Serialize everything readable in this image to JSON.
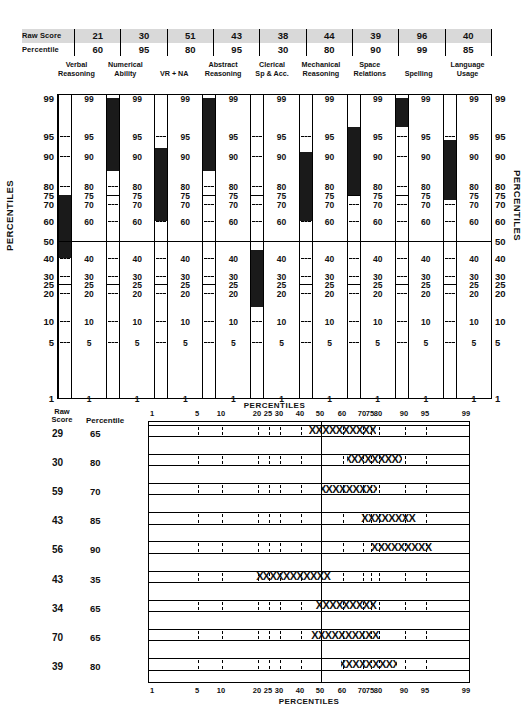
{
  "header": {
    "row_labels": [
      "Raw Score",
      "Percentile"
    ],
    "tests": [
      {
        "name_line1": "Verbal",
        "name_line2": "Reasoning",
        "raw": "21",
        "percentile": "60"
      },
      {
        "name_line1": "Numerical",
        "name_line2": "Ability",
        "raw": "30",
        "percentile": "95"
      },
      {
        "name_line1": "VR + NA",
        "name_line2": "",
        "raw": "51",
        "percentile": "80"
      },
      {
        "name_line1": "Abstract",
        "name_line2": "Reasoning",
        "raw": "43",
        "percentile": "95"
      },
      {
        "name_line1": "Clerical",
        "name_line2": "Sp & Acc.",
        "raw": "38",
        "percentile": "30"
      },
      {
        "name_line1": "Mechanical",
        "name_line2": "Reasoning",
        "raw": "44",
        "percentile": "80"
      },
      {
        "name_line1": "Space",
        "name_line2": "Relations",
        "raw": "39",
        "percentile": "90"
      },
      {
        "name_line1": "Spelling",
        "name_line2": "",
        "raw": "96",
        "percentile": "99"
      },
      {
        "name_line1": "Language",
        "name_line2": "Usage",
        "raw": "40",
        "percentile": "85"
      }
    ]
  },
  "profile_chart": {
    "axis_title": "PERCENTILES",
    "caption": "PERCENTILES",
    "scale_ticks": [
      "99",
      "95",
      "90",
      "80",
      "75",
      "70",
      "60",
      "50",
      "40",
      "30",
      "25",
      "20",
      "10",
      "5",
      "1"
    ],
    "column_labels": [
      "99",
      "95",
      "90",
      "80",
      "75",
      "70",
      "60",
      "40",
      "30",
      "25",
      "20",
      "10",
      "5",
      "1"
    ]
  },
  "bottom_chart": {
    "col_header_line1": "Raw",
    "col_header_line2": "Score",
    "col_header_percentile": "Percentile",
    "caption_top": "PERCENTILES",
    "caption_bottom": "PERCENTILES",
    "axis_ticks": [
      "1",
      "5",
      "10",
      "20",
      "25",
      "30",
      "40",
      "50",
      "60",
      "70",
      "75",
      "80",
      "90",
      "95",
      "99"
    ],
    "rows": [
      {
        "raw": "29",
        "percentile": "65",
        "marks": "XXXXXXXXXX"
      },
      {
        "raw": "30",
        "percentile": "80",
        "marks": "XXXXXXXXX"
      },
      {
        "raw": "59",
        "percentile": "70",
        "marks": "XXXXXXXXX"
      },
      {
        "raw": "43",
        "percentile": "85",
        "marks": "XXXXXXXX"
      },
      {
        "raw": "56",
        "percentile": "90",
        "marks": "XXXXXXXXX"
      },
      {
        "raw": "43",
        "percentile": "35",
        "marks": "XXXXXXXXXXX"
      },
      {
        "raw": "34",
        "percentile": "65",
        "marks": "XXXXXXXXX"
      },
      {
        "raw": "70",
        "percentile": "65",
        "marks": "XXXXXXXXXX"
      },
      {
        "raw": "39",
        "percentile": "80",
        "marks": "XXXXXXXXX"
      }
    ]
  },
  "chart_data": [
    {
      "type": "bar",
      "title": "Differential Aptitude Test Percentile Profile",
      "xlabel": "",
      "ylabel": "PERCENTILES",
      "ylim": [
        1,
        99
      ],
      "grid": true,
      "categories": [
        "Verbal Reasoning",
        "Numerical Ability",
        "VR + NA",
        "Abstract Reasoning",
        "Clerical Sp & Acc.",
        "Mechanical Reasoning",
        "Space Relations",
        "Spelling",
        "Language Usage"
      ],
      "raw_scores": [
        21,
        30,
        51,
        43,
        38,
        44,
        39,
        96,
        40
      ],
      "values": [
        60,
        95,
        80,
        95,
        30,
        80,
        90,
        99,
        85
      ],
      "bands": [
        {
          "category": "Verbal Reasoning",
          "low": 40,
          "high": 75
        },
        {
          "category": "Numerical Ability",
          "low": 85,
          "high": 99
        },
        {
          "category": "VR + NA",
          "low": 60,
          "high": 92
        },
        {
          "category": "Abstract Reasoning",
          "low": 85,
          "high": 99
        },
        {
          "category": "Clerical Sp & Acc.",
          "low": 15,
          "high": 45
        },
        {
          "category": "Mechanical Reasoning",
          "low": 60,
          "high": 91
        },
        {
          "category": "Space Relations",
          "low": 75,
          "high": 96
        },
        {
          "category": "Spelling",
          "low": 96,
          "high": 99
        },
        {
          "category": "Language Usage",
          "low": 72,
          "high": 94
        }
      ],
      "tick_labels": [
        "99",
        "95",
        "90",
        "80",
        "75",
        "70",
        "60",
        "50",
        "40",
        "30",
        "25",
        "20",
        "10",
        "5",
        "1"
      ]
    },
    {
      "type": "bar",
      "title": "Percentile band profile",
      "xlabel": "PERCENTILES",
      "ylabel": "",
      "xlim": [
        1,
        99
      ],
      "grid": true,
      "tick_labels": [
        "1",
        "5",
        "10",
        "20",
        "25",
        "30",
        "40",
        "50",
        "60",
        "70",
        "75",
        "80",
        "90",
        "95",
        "99"
      ],
      "categories": [
        "29 / 65",
        "30 / 80",
        "59 / 70",
        "43 / 85",
        "56 / 90",
        "43 / 35",
        "34 / 65",
        "70 / 65",
        "39 / 80"
      ],
      "raw_scores": [
        29,
        30,
        59,
        43,
        56,
        43,
        34,
        70,
        39
      ],
      "values": [
        65,
        80,
        70,
        85,
        90,
        35,
        65,
        65,
        80
      ],
      "bands": [
        {
          "raw": 29,
          "percentile": 65,
          "low": 44,
          "high": 78
        },
        {
          "raw": 30,
          "percentile": 80,
          "low": 62,
          "high": 89
        },
        {
          "raw": 59,
          "percentile": 70,
          "low": 50,
          "high": 79
        },
        {
          "raw": 43,
          "percentile": 85,
          "low": 68,
          "high": 93
        },
        {
          "raw": 56,
          "percentile": 90,
          "low": 72,
          "high": 96
        },
        {
          "raw": 43,
          "percentile": 35,
          "low": 19,
          "high": 55
        },
        {
          "raw": 34,
          "percentile": 65,
          "low": 46,
          "high": 80
        },
        {
          "raw": 70,
          "percentile": 65,
          "low": 45,
          "high": 80
        },
        {
          "raw": 39,
          "percentile": 80,
          "low": 59,
          "high": 87
        }
      ]
    }
  ],
  "colors": {
    "ink": "#111111",
    "bar_fill": "#1a1a1a",
    "header_band": "#d9d9d9",
    "paper": "#ffffff"
  }
}
